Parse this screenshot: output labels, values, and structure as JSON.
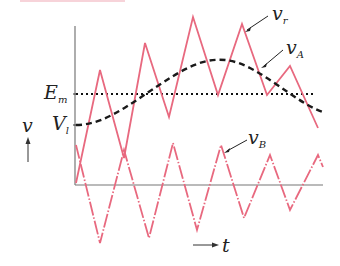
{
  "diagram": {
    "labels": {
      "v_r": "v",
      "v_r_sub": "r",
      "v_A": "v",
      "v_A_sub": "A",
      "v_B": "v",
      "v_B_sub": "B",
      "E_m": "E",
      "E_m_sub": "m",
      "V_l": "V",
      "V_l_sub": "l",
      "y_axis": "v",
      "x_axis": "t"
    },
    "colors": {
      "triangle_waves": "#e8697f",
      "dashed_curve": "#222222",
      "axes": "#777777"
    },
    "curves": {
      "v_r": [
        [
          76,
          183
        ],
        [
          100,
          70
        ],
        [
          124,
          158
        ],
        [
          145,
          43
        ],
        [
          169,
          117
        ],
        [
          193,
          17
        ],
        [
          218,
          95
        ],
        [
          242,
          24
        ],
        [
          267,
          95
        ],
        [
          290,
          66
        ],
        [
          318,
          128
        ]
      ],
      "v_B": [
        [
          76,
          145
        ],
        [
          100,
          243
        ],
        [
          124,
          150
        ],
        [
          149,
          238
        ],
        [
          173,
          143
        ],
        [
          197,
          230
        ],
        [
          221,
          145
        ],
        [
          244,
          218
        ],
        [
          270,
          155
        ],
        [
          290,
          210
        ],
        [
          318,
          155
        ],
        [
          323,
          167
        ]
      ],
      "v_A": "dashed sinusoid from (76,125) through peak ~(218,58) to (323,112)",
      "E_m_level_y": 94
    }
  }
}
